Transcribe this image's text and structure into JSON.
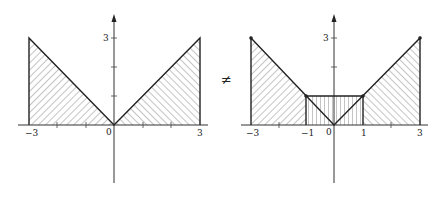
{
  "figure": {
    "relation_symbol": "≠",
    "left_graph": {
      "description": "Region under y = |x| for x in [-3, 3], hatched diagonally",
      "function": "y = |x|",
      "domain": [
        -3,
        3
      ],
      "x_tick_labels": [
        "-3",
        "0",
        "3"
      ],
      "y_tick_labels": [
        "3"
      ],
      "origin_label": "0",
      "hatch": "diagonal"
    },
    "right_graph": {
      "description": "Region under y = |x| with middle rectangle on [-1, 1] up to height 1 hatched vertically; outer regions hatched diagonally",
      "function": "y = max(|x|, 1) over [-3,3]",
      "domain": [
        -3,
        3
      ],
      "x_tick_labels": [
        "-3",
        "-1",
        "0",
        "1",
        "3"
      ],
      "y_tick_labels": [
        "3"
      ],
      "origin_label": "0",
      "rectangle": {
        "x_range": [
          -1,
          1
        ],
        "height": 1,
        "hatch": "vertical"
      },
      "hatch_outer": "diagonal",
      "marked_points": [
        [
          -3,
          3
        ],
        [
          -1,
          1
        ],
        [
          1,
          1
        ],
        [
          3,
          3
        ]
      ]
    }
  }
}
